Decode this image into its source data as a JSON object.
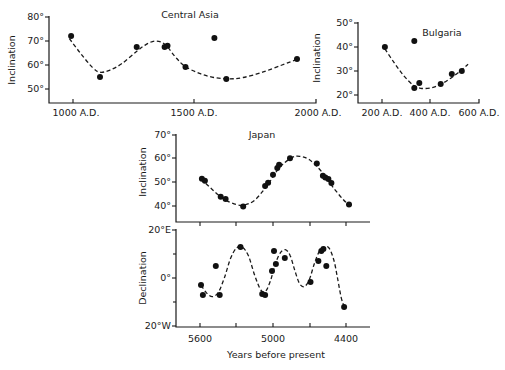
{
  "chart_data": [
    {
      "id": "central_asia",
      "type": "scatter",
      "title": "Central Asia",
      "xlabel": "",
      "ylabel": "Inclination",
      "x_ticks": [
        1000,
        1500,
        2000
      ],
      "x_tick_labels": [
        "1000 A.D.",
        "1500 A.D.",
        "2000 A.D."
      ],
      "y_ticks": [
        50,
        60,
        70,
        80
      ],
      "y_tick_labels": [
        "50°",
        "60°",
        "70°",
        "80°"
      ],
      "xlim": [
        900,
        2000
      ],
      "ylim": [
        44,
        80
      ],
      "grid": false,
      "points": {
        "x": [
          992,
          1111,
          1262,
          1377,
          1389,
          1463,
          1582,
          1631,
          1922
        ],
        "y": [
          72.1,
          55.0,
          67.5,
          67.5,
          68.0,
          59.2,
          71.3,
          54.2,
          62.5
        ]
      },
      "fit_curve": {
        "style": "dashed",
        "x": [
          985,
          1030,
          1080,
          1110,
          1150,
          1200,
          1260,
          1300,
          1340,
          1380,
          1420,
          1460,
          1520,
          1580,
          1640,
          1700,
          1780,
          1860,
          1920
        ],
        "y": [
          71,
          65,
          59,
          57,
          57.8,
          60.5,
          65.5,
          68.5,
          70,
          68.5,
          63.5,
          59.5,
          56.5,
          54.8,
          54.2,
          54.8,
          57,
          60,
          62.3
        ]
      }
    },
    {
      "id": "bulgaria",
      "type": "scatter",
      "title": "Bulgaria",
      "xlabel": "",
      "ylabel": "Inclination",
      "x_ticks": [
        200,
        400,
        600
      ],
      "x_tick_labels": [
        "200 A.D.",
        "400 A.D.",
        "600 A.D."
      ],
      "y_ticks": [
        20,
        30,
        40,
        50
      ],
      "y_tick_labels": [
        "20°",
        "30°",
        "40°",
        "50°"
      ],
      "xlim": [
        100,
        600
      ],
      "ylim": [
        16.5,
        50
      ],
      "grid": false,
      "points": {
        "x": [
          212,
          333,
          333,
          354,
          442,
          488,
          529
        ],
        "y": [
          40.0,
          42.5,
          22.9,
          25.0,
          24.6,
          28.8,
          30.0
        ]
      },
      "fit_curve": {
        "style": "dashed",
        "x": [
          212,
          250,
          290,
          330,
          360,
          400,
          440,
          480,
          520,
          555
        ],
        "y": [
          39.2,
          33.5,
          28,
          24,
          22.8,
          22.9,
          24.3,
          26.8,
          29.8,
          32.8
        ]
      }
    },
    {
      "id": "japan_inclination",
      "type": "scatter",
      "title": "Japan",
      "xlabel": "",
      "ylabel": "Inclination",
      "x_ticks": [
        5600,
        5300,
        5000,
        4700,
        4400
      ],
      "x_tick_labels": [
        "",
        "",
        "",
        "",
        ""
      ],
      "y_ticks": [
        40,
        50,
        60,
        70
      ],
      "y_tick_labels": [
        "40°",
        "50°",
        "60°",
        "70°"
      ],
      "xlim": [
        5800,
        4200
      ],
      "ylim": [
        33,
        70
      ],
      "grid": false,
      "points": {
        "x": [
          5584,
          5560,
          5430,
          5390,
          5245,
          5065,
          5040,
          5000,
          4965,
          4950,
          4860,
          4640,
          4590,
          4570,
          4545,
          4520,
          4375
        ],
        "y": [
          51.5,
          50.7,
          43.9,
          43.0,
          39.8,
          48.5,
          49.8,
          53.2,
          56.1,
          57.4,
          60.2,
          57.9,
          52.8,
          52.1,
          51.4,
          49.7,
          40.6
        ]
      },
      "fit_curve": {
        "style": "dashed",
        "x": [
          5590,
          5500,
          5400,
          5300,
          5230,
          5150,
          5050,
          4950,
          4850,
          4780,
          4700,
          4600,
          4500,
          4400,
          4350
        ],
        "y": [
          51.5,
          47,
          42.8,
          40.6,
          40.5,
          42.5,
          48.5,
          56,
          60.3,
          61,
          59.5,
          54.5,
          47.5,
          41.5,
          40.5
        ]
      }
    },
    {
      "id": "japan_declination",
      "type": "scatter",
      "title": "",
      "xlabel": "Years before present",
      "ylabel": "Declination",
      "x_ticks": [
        5600,
        5300,
        5000,
        4700,
        4400
      ],
      "x_tick_labels": [
        "5600",
        "",
        "5000",
        "",
        "4400"
      ],
      "y_ticks": [
        20,
        10,
        0,
        -10,
        -20
      ],
      "y_tick_labels": [
        "20°E",
        "",
        "0°",
        "",
        "20°W"
      ],
      "xlim": [
        5800,
        4200
      ],
      "ylim": [
        -20,
        20
      ],
      "grid": false,
      "points": {
        "x": [
          5592,
          5576,
          5470,
          5438,
          5267,
          5089,
          5065,
          5008,
          4992,
          4976,
          4903,
          4692,
          4627,
          4603,
          4586,
          4562,
          4416
        ],
        "y": [
          -2.9,
          -7.1,
          5.0,
          -7.1,
          12.9,
          -6.7,
          -7.1,
          2.9,
          11.2,
          5.8,
          8.3,
          -1.7,
          7.1,
          11.2,
          12.1,
          5.0,
          -12.1
        ]
      },
      "fit_curve": {
        "style": "dashed",
        "x": [
          5590,
          5550,
          5500,
          5450,
          5400,
          5350,
          5300,
          5250,
          5200,
          5150,
          5100,
          5060,
          5020,
          4980,
          4940,
          4900,
          4860,
          4820,
          4780,
          4740,
          4700,
          4660,
          4620,
          4580,
          4540,
          4500,
          4470,
          4440,
          4415
        ],
        "y": [
          -3,
          -6,
          -7.8,
          -6,
          0,
          8,
          12.5,
          12.8,
          9,
          1,
          -5,
          -5.5,
          -1,
          6,
          10.5,
          11.8,
          9.5,
          3,
          -2.5,
          -3.5,
          -0.5,
          6,
          11,
          12.8,
          12.5,
          7.5,
          0,
          -8,
          -12
        ]
      }
    }
  ],
  "figure": {
    "panels": [
      {
        "title": "Central Asia",
        "ylabel": "Inclination",
        "x_tick_labels": [
          "1000 A.D.",
          "1500 A.D.",
          "2000 A.D."
        ],
        "y_tick_labels": [
          "50°",
          "60°",
          "70°",
          "80°"
        ]
      },
      {
        "title": "Bulgaria",
        "ylabel": "Inclination",
        "x_tick_labels": [
          "200 A.D.",
          "400 A.D.",
          "600 A.D."
        ],
        "y_tick_labels": [
          "20°",
          "30°",
          "40°",
          "50°"
        ]
      },
      {
        "title": "Japan",
        "ylabel": "Inclination",
        "y_tick_labels": [
          "40°",
          "50°",
          "60°",
          "70°"
        ]
      },
      {
        "ylabel": "Declination",
        "xlabel": "Years before present",
        "x_tick_labels": [
          "5600",
          "5000",
          "4400"
        ],
        "y_tick_labels": [
          "20°E",
          "0°",
          "20°W"
        ]
      }
    ]
  }
}
